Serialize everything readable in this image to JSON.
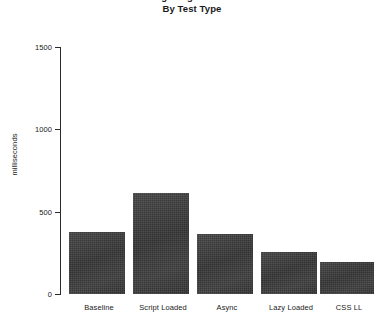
{
  "chart_data": {
    "type": "bar",
    "title": "Average Page Load Time",
    "subtitle": "By Test Type",
    "categories": [
      "Baseline",
      "Script Loaded",
      "Async",
      "Lazy Loaded",
      "CSS LL"
    ],
    "values": [
      376,
      613,
      364,
      255,
      194
    ],
    "xlabel": "",
    "ylabel": "milliseconds",
    "ylim": [
      0,
      1500
    ],
    "ytick_labels": [
      "0",
      "500",
      "1000",
      "1500"
    ],
    "ytick_values": [
      0,
      500,
      1000,
      1500
    ],
    "grid": false,
    "legend": null,
    "bar_color": "#3b3b3b",
    "axis_color": "#2b2b2b",
    "background": "#ffffff"
  }
}
